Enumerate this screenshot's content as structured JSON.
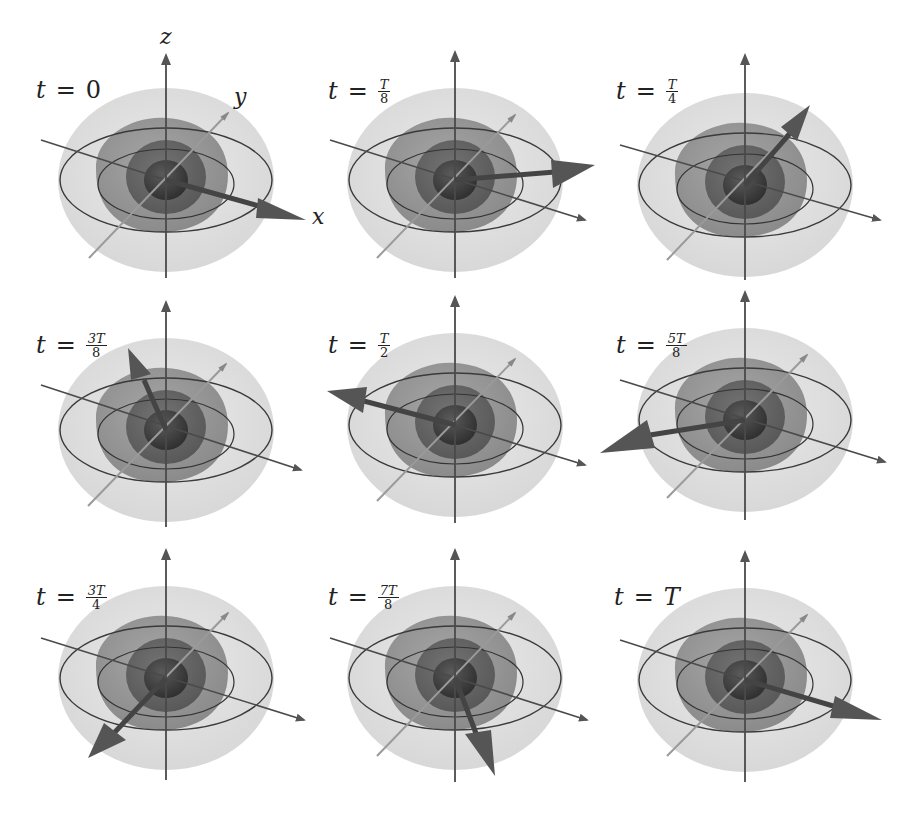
{
  "figure": {
    "axis_labels": {
      "x": "x",
      "y": "y",
      "z": "z"
    },
    "colors": {
      "outer_shell": "#d9d9d9",
      "middle_shell": "#8a8a8a",
      "inner_shell": "#5e5e5e",
      "core": "#3f3f3f",
      "axis": "#4a4a4a",
      "y_axis": "#9a9a9a",
      "ring": "#3a3a3a",
      "arrow": "#555555"
    },
    "panels": [
      {
        "id": "t0",
        "label_prefix": "t",
        "equals": "=",
        "value": "0",
        "frac_num": "",
        "frac_den": "",
        "vector_direction": "+x"
      },
      {
        "id": "t1_8",
        "label_prefix": "t",
        "equals": "=",
        "value": "",
        "frac_num": "T",
        "frac_den": "8",
        "vector_direction": "+x/+y"
      },
      {
        "id": "t1_4",
        "label_prefix": "t",
        "equals": "=",
        "value": "",
        "frac_num": "T",
        "frac_den": "4",
        "vector_direction": "+y"
      },
      {
        "id": "t3_8",
        "label_prefix": "t",
        "equals": "=",
        "value": "",
        "frac_num": "3T",
        "frac_den": "8",
        "vector_direction": "-x/+y"
      },
      {
        "id": "t1_2",
        "label_prefix": "t",
        "equals": "=",
        "value": "",
        "frac_num": "T",
        "frac_den": "2",
        "vector_direction": "-x"
      },
      {
        "id": "t5_8",
        "label_prefix": "t",
        "equals": "=",
        "value": "",
        "frac_num": "5T",
        "frac_den": "8",
        "vector_direction": "-x/-y"
      },
      {
        "id": "t3_4",
        "label_prefix": "t",
        "equals": "=",
        "value": "",
        "frac_num": "3T",
        "frac_den": "4",
        "vector_direction": "-y"
      },
      {
        "id": "t7_8",
        "label_prefix": "t",
        "equals": "=",
        "value": "",
        "frac_num": "7T",
        "frac_den": "8",
        "vector_direction": "+x/-y"
      },
      {
        "id": "tT",
        "label_prefix": "t",
        "equals": "=",
        "value": "T",
        "frac_num": "",
        "frac_den": "",
        "vector_direction": "+x"
      }
    ]
  }
}
